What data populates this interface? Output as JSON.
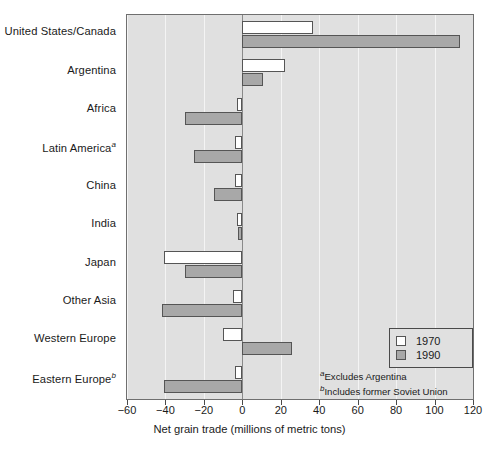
{
  "chart_data": {
    "type": "bar",
    "orientation": "horizontal",
    "title": "",
    "xlabel": "Net grain trade (millions of metric tons)",
    "ylabel": "",
    "xlim": [
      -60,
      120
    ],
    "xticks": [
      -60,
      -40,
      -20,
      0,
      20,
      40,
      60,
      80,
      100,
      120
    ],
    "xtick_labels": [
      "−60",
      "−40",
      "−20",
      "0",
      "20",
      "40",
      "60",
      "80",
      "100",
      "120"
    ],
    "grid": true,
    "grid_axis": "x",
    "legend_position": "right-inside",
    "categories": [
      "United States/Canada",
      "Argentina",
      "Africa",
      "Latin America",
      "China",
      "India",
      "Japan",
      "Other Asia",
      "Western Europe",
      "Eastern Europe"
    ],
    "category_footnote_marks": [
      "",
      "",
      "",
      "a",
      "",
      "",
      "",
      "",
      "",
      "b"
    ],
    "series": [
      {
        "name": "1970",
        "color": "#ffffff",
        "values": [
          37,
          22,
          -3,
          -4,
          -4,
          -3,
          -41,
          -5,
          -10,
          -4
        ]
      },
      {
        "name": "1990",
        "color": "#a8a8a8",
        "values": [
          113,
          11,
          -30,
          -25,
          -15,
          -2,
          -30,
          -42,
          26,
          -41
        ]
      }
    ]
  },
  "legend": {
    "items": [
      {
        "label": "1970",
        "swatch": "open-square"
      },
      {
        "label": "1990",
        "swatch": "filled-square"
      }
    ]
  },
  "footnotes": [
    {
      "mark": "a",
      "text": "Excludes Argentina"
    },
    {
      "mark": "b",
      "text": "Includes former Soviet Union"
    }
  ],
  "colors": {
    "plot_background": "#e0e0e0",
    "gridline": "#f4f4f4",
    "zeroline": "#8a8a8a",
    "frame": "#6f6f6f",
    "bar_1970": "#ffffff",
    "bar_1990": "#a8a8a8",
    "bar_outline": "#555555",
    "text": "#1a1a1a"
  }
}
